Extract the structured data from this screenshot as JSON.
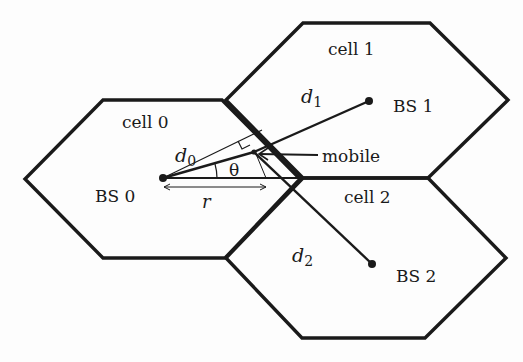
{
  "diagram": {
    "title": "",
    "colors": {
      "stroke": "#1a1a1a",
      "background": "#fdfdfd"
    },
    "cells": [
      {
        "label": "cell 0",
        "base_station": "BS 0"
      },
      {
        "label": "cell 1",
        "base_station": "BS 1"
      },
      {
        "label": "cell 2",
        "base_station": "BS 2"
      }
    ],
    "distances": {
      "d0": {
        "main": "d",
        "sub": "0"
      },
      "d1": {
        "main": "d",
        "sub": "1"
      },
      "d2": {
        "main": "d",
        "sub": "2"
      }
    },
    "angle_label": "θ",
    "radius_label": "r",
    "mobile_label": "mobile"
  }
}
